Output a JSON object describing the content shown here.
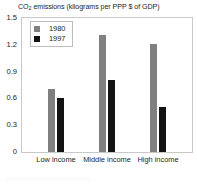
{
  "chart_data": {
    "type": "bar",
    "title": "CO2 emissions (kilograms per PPP $ of GDP)",
    "title_prefix": "CO",
    "title_sub": "2",
    "title_rest": " emissions (kilograms per PPP $ of GDP)",
    "categories": [
      "Low income",
      "Middle income",
      "High income"
    ],
    "series": [
      {
        "name": "1980",
        "color": "#808080",
        "values": [
          0.7,
          1.31,
          1.21
        ]
      },
      {
        "name": "1997",
        "color": "#131313",
        "values": [
          0.6,
          0.81,
          0.5
        ]
      }
    ],
    "xlabel": "",
    "ylabel": "",
    "ylim": [
      0,
      1.5
    ],
    "yticks": [
      "1.5",
      "1.2",
      "0.9",
      "0.6",
      "0.3",
      "0"
    ],
    "ytick_values": [
      1.5,
      1.2,
      0.9,
      0.6,
      0.3,
      0
    ],
    "grid": false,
    "legend_position": "upper-left-inside"
  }
}
